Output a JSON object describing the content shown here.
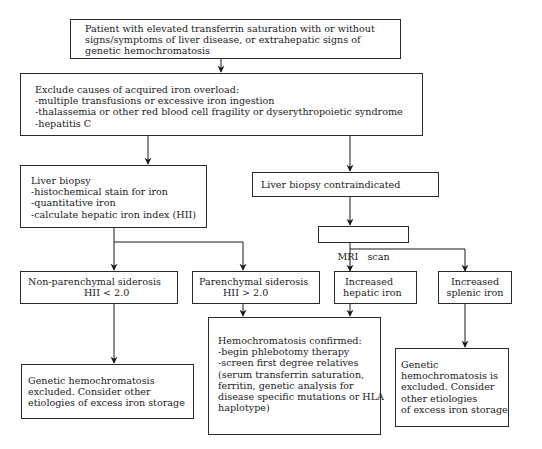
{
  "flowchart": {
    "start": {
      "lines": [
        "Patient with elevated transferrin saturation with or without",
        "signs/symptoms of liver disease, or extrahepatic signs of",
        "genetic hemochromatosis"
      ]
    },
    "exclude": {
      "lines": [
        "Exclude causes of acquired iron overload:",
        "-multiple transfusions or excessive iron ingestion",
        "-thalassemia or other red blood cell fragility or dyserythropoietic syndrome",
        "-hepatitis C"
      ]
    },
    "liver_biopsy": {
      "lines": [
        "Liver biopsy",
        "-histochemical stain for iron",
        "-quantitative iron",
        "-calculate hepatic iron index (HII)"
      ]
    },
    "biopsy_contraindicated": {
      "lines": [
        "Liver biopsy contraindicated"
      ]
    },
    "mri": {
      "lines": [
        "MRI   scan"
      ]
    },
    "non_parenchymal": {
      "lines": [
        "Non-parenchymal siderosis",
        "HII < 2.0"
      ]
    },
    "parenchymal": {
      "lines": [
        "Parenchymal siderosis",
        "HII > 2.0"
      ]
    },
    "hepatic_iron": {
      "lines": [
        "Increased",
        "hepatic iron"
      ]
    },
    "splenic_iron": {
      "lines": [
        "Increased",
        "splenic iron"
      ]
    },
    "excluded_left": {
      "lines": [
        "Genetic hemochromatosis",
        "excluded. Consider other",
        "etiologies of excess iron storage"
      ]
    },
    "confirmed": {
      "lines": [
        "Hemochromatosis confirmed:",
        "-begin phlebotomy therapy",
        "-screen first degree relatives",
        "(serum transferrin saturation,",
        "ferritin, genetic analysis for",
        "disease specific mutations or HLA",
        "haplotype)"
      ]
    },
    "excluded_right": {
      "lines": [
        "Genetic",
        "hemochromatosis is",
        "excluded. Consider",
        "other etiologies",
        "of excess iron storage"
      ]
    }
  },
  "colors": {
    "line": "#1a1a1a",
    "background": "#ffffff"
  }
}
